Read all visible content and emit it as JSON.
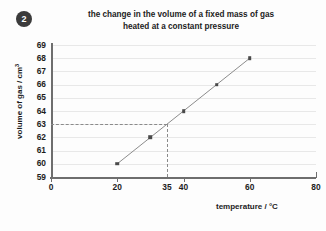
{
  "question_number": "2",
  "chart_data": {
    "type": "line",
    "title": "the change in the volume of a fixed mass of gas heated at a constant pressure",
    "title_lines": [
      "the change in the volume of a fixed mass of gas",
      "heated at a constant pressure"
    ],
    "xlabel": "temperature / °C",
    "ylabel_text": "volume of gas / cm",
    "ylabel_sup": "3",
    "ylabel": "volume of gas / cm³",
    "x": [
      20,
      30,
      40,
      50,
      60
    ],
    "values": [
      60,
      62,
      64,
      66,
      68
    ],
    "series": [
      {
        "name": "volume of gas",
        "points": [
          {
            "x": 20,
            "y": 60
          },
          {
            "x": 30,
            "y": 62
          },
          {
            "x": 40,
            "y": 64
          },
          {
            "x": 50,
            "y": 66
          },
          {
            "x": 60,
            "y": 68
          }
        ]
      }
    ],
    "xlim": [
      0,
      80
    ],
    "ylim": [
      59,
      69
    ],
    "xticks": [
      0,
      20,
      35,
      40,
      60,
      80
    ],
    "xtick_labels": [
      "0",
      "20",
      "35",
      "40",
      "60",
      "80"
    ],
    "xticks_with_marks": [
      0,
      20,
      40,
      60,
      80
    ],
    "yticks": [
      59,
      60,
      61,
      62,
      63,
      64,
      65,
      66,
      67,
      68,
      69
    ],
    "ytick_labels": [
      "59",
      "60",
      "61",
      "62",
      "63",
      "64",
      "65",
      "66",
      "67",
      "68",
      "69"
    ],
    "grid": "horizontal",
    "legend": "none",
    "annotations": [
      {
        "type": "construction-line",
        "description": "dashed guide from y-axis at volume 63 across to the line, then down to temperature 35",
        "y_value": 63,
        "x_value": 35
      }
    ],
    "marker_color": "#4a4a4a",
    "line_color": "#8c8c8c",
    "grid_color": "#e8e8e8",
    "axis_color": "#6e6e6e",
    "dash_color": "#8a8a8a"
  }
}
